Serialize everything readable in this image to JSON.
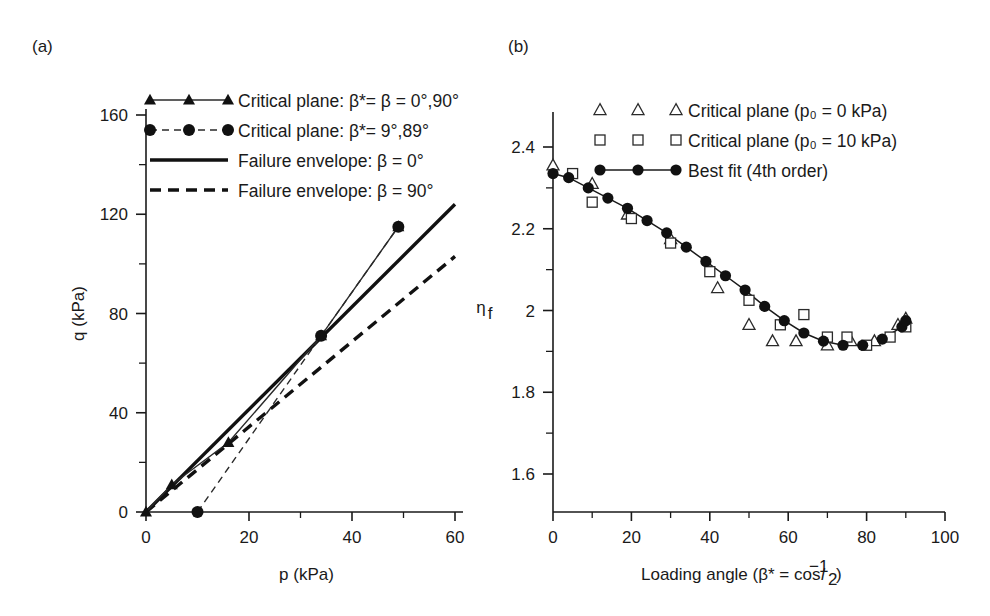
{
  "figure": {
    "panel_a_label": "(a)",
    "panel_b_label": "(b)"
  },
  "panel_a": {
    "xlabel": "p (kPa)",
    "ylabel": "q (kPa)",
    "xticks": [
      "0",
      "20",
      "40",
      "60"
    ],
    "yticks": [
      "0",
      "40",
      "80",
      "120",
      "160"
    ],
    "xlim": [
      0,
      60
    ],
    "ylim": [
      0,
      160
    ],
    "legend": [
      {
        "label": "Critical plane: β*= β = 0°,90°",
        "marker": "triangle-filled",
        "line": "solid-thin"
      },
      {
        "label": "Critical plane: β*= 9°,89°",
        "marker": "circle-filled",
        "line": "dashed-thin"
      },
      {
        "label": "Failure envelope: β = 0°",
        "marker": "none",
        "line": "solid-heavy"
      },
      {
        "label": "Failure envelope: β = 90°",
        "marker": "none",
        "line": "dashed-heavy"
      }
    ]
  },
  "panel_b": {
    "xlabel_parts": {
      "prefix": "Loading angle (β* = cos",
      "sup": "−1",
      "var": "l",
      "sub": "2",
      "suffix": ")"
    },
    "ylabel_parts": {
      "main": "η",
      "sub": "f"
    },
    "xticks": [
      "0",
      "20",
      "40",
      "60",
      "80",
      "100"
    ],
    "yticks": [
      "1.6",
      "1.8",
      "2",
      "2.2",
      "2.4"
    ],
    "xlim": [
      0,
      100
    ],
    "ylim": [
      1.5,
      2.5
    ],
    "legend": [
      {
        "label": "Critical plane (p₀ = 0 kPa)",
        "marker": "triangle-open",
        "line": "none"
      },
      {
        "label": "Critical plane (p₀ = 10 kPa)",
        "marker": "square-open",
        "line": "none"
      },
      {
        "label": "Best fit (4th order)",
        "marker": "circle-filled",
        "line": "solid-thin"
      }
    ]
  },
  "chart_data": [
    {
      "type": "line",
      "panel": "(a)",
      "title": "",
      "xlabel": "p (kPa)",
      "ylabel": "q (kPa)",
      "xlim": [
        0,
        60
      ],
      "ylim": [
        0,
        160
      ],
      "xticks": [
        0,
        20,
        40,
        60
      ],
      "yticks": [
        0,
        40,
        80,
        120,
        160
      ],
      "minor_ticks": true,
      "grid": false,
      "legend_position": "top-left-outside",
      "series": [
        {
          "name": "Critical plane: β*= β = 0°,90°",
          "style": "solid-thin-with-triangles",
          "marker": "triangle-filled",
          "x": [
            0,
            5,
            16,
            34,
            49
          ],
          "y": [
            0,
            11,
            28,
            71,
            115
          ]
        },
        {
          "name": "Critical plane: β*= 9°,89°",
          "style": "dashed-thin-with-circles",
          "marker": "circle-filled",
          "x": [
            10,
            34,
            49
          ],
          "y": [
            0,
            71,
            115
          ]
        },
        {
          "name": "Failure envelope: β = 0°",
          "style": "solid-heavy",
          "marker": "none",
          "x": [
            0,
            60
          ],
          "y": [
            0,
            124
          ]
        },
        {
          "name": "Failure envelope: β = 90°",
          "style": "dashed-heavy",
          "marker": "none",
          "x": [
            0,
            60
          ],
          "y": [
            0,
            103
          ]
        }
      ]
    },
    {
      "type": "scatter",
      "panel": "(b)",
      "title": "",
      "xlabel": "Loading angle (β* = cos−1 l2)",
      "ylabel": "ηf",
      "xlim": [
        0,
        100
      ],
      "ylim": [
        1.5,
        2.5
      ],
      "xticks": [
        0,
        20,
        40,
        60,
        80,
        100
      ],
      "yticks": [
        1.6,
        1.8,
        2.0,
        2.2,
        2.4
      ],
      "minor_ticks": true,
      "grid": false,
      "legend_position": "top-right-inside",
      "series": [
        {
          "name": "Critical plane (p₀ = 0 kPa)",
          "marker": "triangle-open",
          "line": "none",
          "x": [
            0,
            10,
            19,
            30,
            42,
            50,
            56,
            62,
            70,
            76,
            82,
            88,
            90
          ],
          "y": [
            2.355,
            2.31,
            2.235,
            2.175,
            2.055,
            1.965,
            1.925,
            1.925,
            1.915,
            1.925,
            1.925,
            1.965,
            1.98
          ]
        },
        {
          "name": "Critical plane (p₀ = 10 kPa)",
          "marker": "square-open",
          "line": "none",
          "x": [
            5,
            10,
            20,
            30,
            40,
            50,
            58,
            64,
            70,
            75,
            80,
            86,
            90
          ],
          "y": [
            2.335,
            2.265,
            2.225,
            2.165,
            2.095,
            2.025,
            1.965,
            1.99,
            1.935,
            1.935,
            1.915,
            1.935,
            1.96
          ]
        },
        {
          "name": "Best fit (4th order)",
          "marker": "circle-filled",
          "line": "solid-thin",
          "x": [
            0,
            4,
            9,
            14,
            19,
            24,
            29,
            34,
            39,
            44,
            49,
            54,
            59,
            64,
            69,
            74,
            79,
            84,
            89,
            90
          ],
          "y": [
            2.335,
            2.325,
            2.3,
            2.275,
            2.25,
            2.22,
            2.19,
            2.155,
            2.12,
            2.085,
            2.05,
            2.01,
            1.975,
            1.945,
            1.925,
            1.915,
            1.915,
            1.93,
            1.96,
            1.975
          ]
        }
      ]
    }
  ]
}
